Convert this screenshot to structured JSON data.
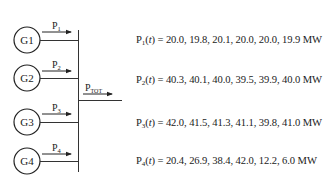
{
  "diagram": {
    "generators": [
      {
        "label": "G1",
        "flow_label": "P",
        "flow_sub": "1"
      },
      {
        "label": "G2",
        "flow_label": "P",
        "flow_sub": "2"
      },
      {
        "label": "G3",
        "flow_label": "P",
        "flow_sub": "3"
      },
      {
        "label": "G4",
        "flow_label": "P",
        "flow_sub": "4"
      }
    ],
    "total": {
      "label": "P",
      "sub": "TOT"
    }
  },
  "equations": [
    {
      "sym": "P",
      "sub": "1",
      "arg": "t",
      "values": "= 20.0, 19.8, 20.1, 20.0, 20.0, 19.9 MW"
    },
    {
      "sym": "P",
      "sub": "2",
      "arg": "t",
      "values": "= 40.3, 40.1, 40.0, 39.5, 39.9, 40.0 MW"
    },
    {
      "sym": "P",
      "sub": "3",
      "arg": "t",
      "values": "= 42.0, 41.5, 41.3, 41.1, 39.8, 41.0 MW"
    },
    {
      "sym": "P",
      "sub": "4",
      "arg": "t",
      "values": "= 20.4, 26.9, 38.4, 42.0, 12.2, 6.0 MW"
    }
  ]
}
